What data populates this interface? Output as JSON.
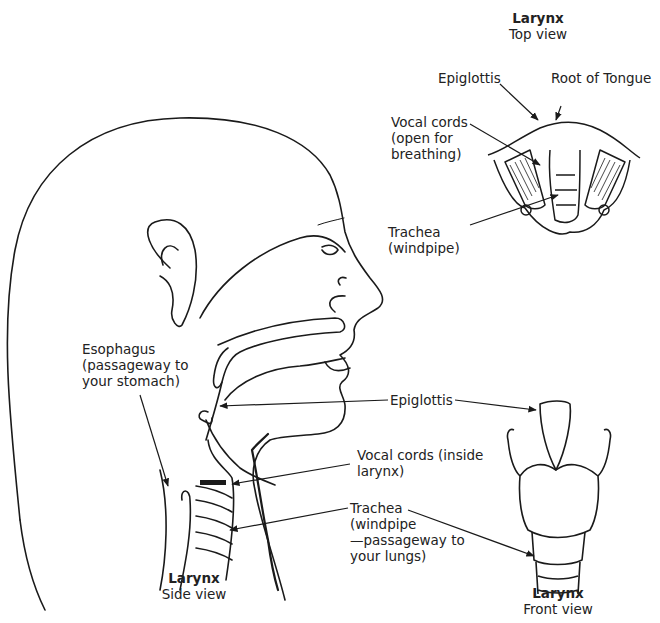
{
  "diagram": {
    "views": {
      "top": {
        "title": "Larynx",
        "subtitle": "Top view"
      },
      "side": {
        "title": "Larynx",
        "subtitle": "Side view"
      },
      "front": {
        "title": "Larynx",
        "subtitle": "Front view"
      }
    },
    "labels": {
      "top_epiglottis": "Epiglottis",
      "root_of_tongue": "Root of Tongue",
      "top_vocal_cords": [
        "Vocal cords",
        "(open for",
        "breathing)"
      ],
      "top_trachea": [
        "Trachea",
        "(windpipe)"
      ],
      "esophagus": [
        "Esophagus",
        "(passageway to",
        "your stomach)"
      ],
      "side_epiglottis": "Epiglottis",
      "side_vocal_cords": [
        "Vocal cords (inside",
        "larynx)"
      ],
      "side_trachea": [
        "Trachea",
        "(windpipe",
        "—passageway to",
        "your lungs)"
      ]
    },
    "colors": {
      "ink": "#1a1a1a",
      "background": "#ffffff"
    }
  }
}
